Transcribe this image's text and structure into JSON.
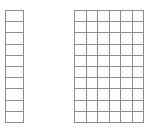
{
  "figure": {
    "background_color": "#ffffff",
    "line_color": "#8c8c8c",
    "cell_fill_color": "#ffffff",
    "grids": [
      {
        "name": "left-grid",
        "columns": 1,
        "rows": 10,
        "total_cells": 10,
        "x": 5,
        "y": 10,
        "width": 19,
        "height": 113
      },
      {
        "name": "right-grid",
        "columns": 6,
        "rows": 10,
        "total_cells": 60,
        "x": 74,
        "y": 10,
        "width": 70,
        "height": 113
      }
    ]
  },
  "chart_data": {
    "type": "table",
    "title": "",
    "xlabel": "",
    "ylabel": "",
    "grid": true,
    "legend": null,
    "annotations": [],
    "series": [
      {
        "name": "left-grid",
        "columns": 1,
        "rows": 10,
        "values": [
          1,
          1,
          1,
          1,
          1,
          1,
          1,
          1,
          1,
          1
        ]
      },
      {
        "name": "right-grid",
        "columns": 6,
        "rows": 10,
        "values": [
          6,
          6,
          6,
          6,
          6,
          6,
          6,
          6,
          6,
          6
        ]
      }
    ]
  }
}
